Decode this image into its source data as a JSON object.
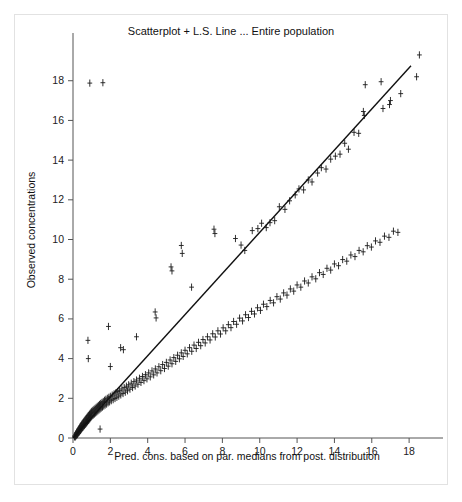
{
  "figure": {
    "title": "Scatterplot + L.S. Line ... Entire population",
    "background_color": "#ffffff",
    "panel_border_color": "#e2e2e2",
    "ink_color": "#1a1a1a"
  },
  "chart_data": {
    "type": "scatter",
    "title": "Scatterplot + L.S. Line ... Entire population",
    "xlabel": "Pred. cons. based on par. medians from post. distribution",
    "ylabel": "Observed concentrations",
    "xlim": [
      0,
      19.6
    ],
    "ylim": [
      0,
      19.8
    ],
    "xticks": [
      0,
      2,
      4,
      6,
      8,
      10,
      12,
      14,
      16,
      18
    ],
    "xtick_labels": [
      "0",
      "2",
      "4",
      "6",
      "8",
      "10",
      "12",
      "14",
      "16",
      "18"
    ],
    "yticks": [
      0,
      2,
      4,
      6,
      8,
      10,
      12,
      14,
      16,
      18
    ],
    "ytick_labels": [
      "0",
      "2",
      "4",
      "6",
      "8",
      "10",
      "12",
      "14",
      "16",
      "18"
    ],
    "grid": false,
    "legend": false,
    "marker": "error-bar-cross",
    "marker_color": "#1a1a1a",
    "series": [
      {
        "name": "Observed vs predicted concentrations",
        "points": [
          [
            0.08,
            0.06
          ],
          [
            0.1,
            0.12
          ],
          [
            0.12,
            0.05
          ],
          [
            0.14,
            0.18
          ],
          [
            0.15,
            0.09
          ],
          [
            0.17,
            0.22
          ],
          [
            0.18,
            0.14
          ],
          [
            0.2,
            0.28
          ],
          [
            0.21,
            0.16
          ],
          [
            0.23,
            0.31
          ],
          [
            0.24,
            0.19
          ],
          [
            0.26,
            0.36
          ],
          [
            0.27,
            0.24
          ],
          [
            0.29,
            0.41
          ],
          [
            0.3,
            0.27
          ],
          [
            0.32,
            0.46
          ],
          [
            0.33,
            0.3
          ],
          [
            0.35,
            0.5
          ],
          [
            0.36,
            0.34
          ],
          [
            0.38,
            0.55
          ],
          [
            0.4,
            0.38
          ],
          [
            0.41,
            0.6
          ],
          [
            0.43,
            0.42
          ],
          [
            0.45,
            0.64
          ],
          [
            0.46,
            0.47
          ],
          [
            0.48,
            0.7
          ],
          [
            0.5,
            0.51
          ],
          [
            0.52,
            0.75
          ],
          [
            0.54,
            0.55
          ],
          [
            0.56,
            0.8
          ],
          [
            0.58,
            0.6
          ],
          [
            0.6,
            0.85
          ],
          [
            0.62,
            0.64
          ],
          [
            0.64,
            0.9
          ],
          [
            0.66,
            0.69
          ],
          [
            0.68,
            0.95
          ],
          [
            0.7,
            0.73
          ],
          [
            0.72,
            1.0
          ],
          [
            0.74,
            0.78
          ],
          [
            0.76,
            1.05
          ],
          [
            0.78,
            0.83
          ],
          [
            0.8,
            1.1
          ],
          [
            0.82,
            0.88
          ],
          [
            0.84,
            1.14
          ],
          [
            0.86,
            0.92
          ],
          [
            0.88,
            1.19
          ],
          [
            0.9,
            0.97
          ],
          [
            0.92,
            1.24
          ],
          [
            0.94,
            1.02
          ],
          [
            0.96,
            1.29
          ],
          [
            0.98,
            1.07
          ],
          [
            1.0,
            1.34
          ],
          [
            1.03,
            1.12
          ],
          [
            1.06,
            1.39
          ],
          [
            1.09,
            1.16
          ],
          [
            1.12,
            1.44
          ],
          [
            1.15,
            1.21
          ],
          [
            1.18,
            1.49
          ],
          [
            1.21,
            1.26
          ],
          [
            1.24,
            1.54
          ],
          [
            1.27,
            1.31
          ],
          [
            1.3,
            1.59
          ],
          [
            1.33,
            1.36
          ],
          [
            1.36,
            1.64
          ],
          [
            1.39,
            1.41
          ],
          [
            1.42,
            1.69
          ],
          [
            1.45,
            1.46
          ],
          [
            1.48,
            1.74
          ],
          [
            1.51,
            1.51
          ],
          [
            1.55,
            1.79
          ],
          [
            1.58,
            1.56
          ],
          [
            1.62,
            1.84
          ],
          [
            1.65,
            1.61
          ],
          [
            1.69,
            1.9
          ],
          [
            1.72,
            1.66
          ],
          [
            1.76,
            1.95
          ],
          [
            1.8,
            1.71
          ],
          [
            1.84,
            2.0
          ],
          [
            1.88,
            1.77
          ],
          [
            1.92,
            2.05
          ],
          [
            1.96,
            1.82
          ],
          [
            2.0,
            2.1
          ],
          [
            2.05,
            1.88
          ],
          [
            2.1,
            2.16
          ],
          [
            2.15,
            1.93
          ],
          [
            2.2,
            2.22
          ],
          [
            2.25,
            1.99
          ],
          [
            2.3,
            2.28
          ],
          [
            2.35,
            2.05
          ],
          [
            2.4,
            2.34
          ],
          [
            2.45,
            2.11
          ],
          [
            2.5,
            2.4
          ],
          [
            2.56,
            2.17
          ],
          [
            2.62,
            2.47
          ],
          [
            2.68,
            2.24
          ],
          [
            2.74,
            2.54
          ],
          [
            2.8,
            2.31
          ],
          [
            2.86,
            2.61
          ],
          [
            2.92,
            2.38
          ],
          [
            2.98,
            2.68
          ],
          [
            3.05,
            2.46
          ],
          [
            3.12,
            2.76
          ],
          [
            3.19,
            2.54
          ],
          [
            3.26,
            2.84
          ],
          [
            3.33,
            2.62
          ],
          [
            3.4,
            2.92
          ],
          [
            3.48,
            2.71
          ],
          [
            3.56,
            3.01
          ],
          [
            3.64,
            2.8
          ],
          [
            3.72,
            3.1
          ],
          [
            3.8,
            2.89
          ],
          [
            3.88,
            3.19
          ],
          [
            3.96,
            2.98
          ],
          [
            4.05,
            3.28
          ],
          [
            4.14,
            3.08
          ],
          [
            4.23,
            3.38
          ],
          [
            4.32,
            3.18
          ],
          [
            4.41,
            3.48
          ],
          [
            4.5,
            3.28
          ],
          [
            4.6,
            3.59
          ],
          [
            4.7,
            3.39
          ],
          [
            4.8,
            3.7
          ],
          [
            4.9,
            3.5
          ],
          [
            5.0,
            3.81
          ],
          [
            5.1,
            3.62
          ],
          [
            5.2,
            3.93
          ],
          [
            5.3,
            3.74
          ],
          [
            5.4,
            4.05
          ],
          [
            5.5,
            3.86
          ],
          [
            5.6,
            4.17
          ],
          [
            5.7,
            3.99
          ],
          [
            5.8,
            4.29
          ],
          [
            5.9,
            4.11
          ],
          [
            6.0,
            4.42
          ],
          [
            6.12,
            4.24
          ],
          [
            6.24,
            4.55
          ],
          [
            6.36,
            4.37
          ],
          [
            6.48,
            4.68
          ],
          [
            6.6,
            4.51
          ],
          [
            6.72,
            4.82
          ],
          [
            6.84,
            4.65
          ],
          [
            6.96,
            4.96
          ],
          [
            7.08,
            4.79
          ],
          [
            7.2,
            5.1
          ],
          [
            7.34,
            4.94
          ],
          [
            7.48,
            5.25
          ],
          [
            7.62,
            5.09
          ],
          [
            7.76,
            5.4
          ],
          [
            7.9,
            5.24
          ],
          [
            8.04,
            5.55
          ],
          [
            8.18,
            5.4
          ],
          [
            8.32,
            5.71
          ],
          [
            8.46,
            5.56
          ],
          [
            8.6,
            5.87
          ],
          [
            8.76,
            5.73
          ],
          [
            8.92,
            6.04
          ],
          [
            9.08,
            5.9
          ],
          [
            9.24,
            6.21
          ],
          [
            9.4,
            6.07
          ],
          [
            9.56,
            6.38
          ],
          [
            9.72,
            6.25
          ],
          [
            9.88,
            6.56
          ],
          [
            10.04,
            6.43
          ],
          [
            10.2,
            6.74
          ],
          [
            10.38,
            6.62
          ],
          [
            10.56,
            6.93
          ],
          [
            10.74,
            6.81
          ],
          [
            10.92,
            7.12
          ],
          [
            11.1,
            7.0
          ],
          [
            11.28,
            7.31
          ],
          [
            11.46,
            7.2
          ],
          [
            11.64,
            7.51
          ],
          [
            11.82,
            7.4
          ],
          [
            12.0,
            7.71
          ],
          [
            12.2,
            7.6
          ],
          [
            12.4,
            7.91
          ],
          [
            12.6,
            7.81
          ],
          [
            12.8,
            8.12
          ],
          [
            13.0,
            8.02
          ],
          [
            13.2,
            8.33
          ],
          [
            13.4,
            8.24
          ],
          [
            13.6,
            8.55
          ],
          [
            13.8,
            8.46
          ],
          [
            14.0,
            8.77
          ],
          [
            14.22,
            8.68
          ],
          [
            14.44,
            8.99
          ],
          [
            14.66,
            8.91
          ],
          [
            14.88,
            9.22
          ],
          [
            15.1,
            9.14
          ],
          [
            15.32,
            9.45
          ],
          [
            15.54,
            9.38
          ],
          [
            15.76,
            9.69
          ],
          [
            15.98,
            9.62
          ],
          [
            16.2,
            9.93
          ],
          [
            16.44,
            9.86
          ],
          [
            16.68,
            10.17
          ],
          [
            16.92,
            10.11
          ],
          [
            17.16,
            10.42
          ],
          [
            17.4,
            10.36
          ],
          [
            1.6,
            17.9
          ],
          [
            0.9,
            17.88
          ],
          [
            0.8,
            4.92
          ],
          [
            0.82,
            4.0
          ],
          [
            1.9,
            5.62
          ],
          [
            2.55,
            4.55
          ],
          [
            2.7,
            4.45
          ],
          [
            3.4,
            5.1
          ],
          [
            5.25,
            8.62
          ],
          [
            5.3,
            8.42
          ],
          [
            5.8,
            9.7
          ],
          [
            5.85,
            9.3
          ],
          [
            7.55,
            10.52
          ],
          [
            7.6,
            10.3
          ],
          [
            4.4,
            6.35
          ],
          [
            4.45,
            6.05
          ],
          [
            6.35,
            7.6
          ],
          [
            2.0,
            3.6
          ],
          [
            1.45,
            0.45
          ],
          [
            8.7,
            10.05
          ],
          [
            9.0,
            9.72
          ],
          [
            9.2,
            9.45
          ],
          [
            9.6,
            10.45
          ],
          [
            9.9,
            10.55
          ],
          [
            10.1,
            10.82
          ],
          [
            10.35,
            10.6
          ],
          [
            10.55,
            10.85
          ],
          [
            10.8,
            10.95
          ],
          [
            11.05,
            11.65
          ],
          [
            11.35,
            11.52
          ],
          [
            11.6,
            11.95
          ],
          [
            11.9,
            12.25
          ],
          [
            12.1,
            12.55
          ],
          [
            12.35,
            12.5
          ],
          [
            12.6,
            13.0
          ],
          [
            12.8,
            12.9
          ],
          [
            13.1,
            13.35
          ],
          [
            13.3,
            13.62
          ],
          [
            13.55,
            13.55
          ],
          [
            13.8,
            14.05
          ],
          [
            14.05,
            14.2
          ],
          [
            14.3,
            14.3
          ],
          [
            14.55,
            14.85
          ],
          [
            14.75,
            14.55
          ],
          [
            15.05,
            15.4
          ],
          [
            15.3,
            15.35
          ],
          [
            15.55,
            16.45
          ],
          [
            15.6,
            16.25
          ],
          [
            15.65,
            17.8
          ],
          [
            16.5,
            17.95
          ],
          [
            16.6,
            16.6
          ],
          [
            17.0,
            17.0
          ],
          [
            18.4,
            18.2
          ],
          [
            18.55,
            19.3
          ],
          [
            17.55,
            17.35
          ],
          [
            16.95,
            16.8
          ]
        ]
      }
    ],
    "fit_line": {
      "name": "L.S. Line",
      "type": "least-squares",
      "x0": 0.0,
      "y0": 0.0,
      "x1": 18.1,
      "y1": 18.75,
      "color": "#111111"
    }
  }
}
